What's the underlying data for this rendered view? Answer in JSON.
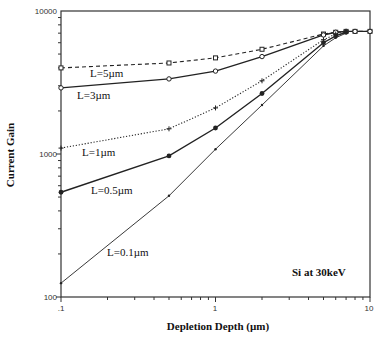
{
  "chart_data": {
    "type": "line",
    "title": "",
    "xlabel": "Depletion Depth (µm)",
    "ylabel": "Current Gain",
    "xscale": "log",
    "yscale": "log",
    "xlim": [
      0.1,
      10
    ],
    "ylim": [
      100,
      10000
    ],
    "x_tick_labels": [
      ".1",
      "1",
      "10"
    ],
    "y_tick_labels": [
      "100",
      "1000",
      "10000"
    ],
    "grid": false,
    "annotations": [
      "Si at 30keV"
    ],
    "series": [
      {
        "name": "L=5µm",
        "style": "dashed",
        "marker": "square",
        "x": [
          0.1,
          0.5,
          1,
          2,
          5,
          6,
          7,
          8,
          10
        ],
        "y": [
          4000,
          4330,
          4700,
          5400,
          6900,
          7100,
          7200,
          7200,
          7200
        ]
      },
      {
        "name": "L=3µm",
        "style": "solid",
        "marker": "circle-open",
        "x": [
          0.1,
          0.5,
          1,
          2,
          5,
          6,
          7,
          8,
          10
        ],
        "y": [
          2900,
          3350,
          3800,
          4800,
          6800,
          7100,
          7200,
          7200,
          7200
        ]
      },
      {
        "name": "L=1µm",
        "style": "dotted",
        "marker": "plus",
        "x": [
          0.1,
          0.5,
          1,
          2,
          5,
          6,
          7
        ],
        "y": [
          1100,
          1500,
          2100,
          3250,
          6300,
          6900,
          7200
        ]
      },
      {
        "name": "L=0.5µm",
        "style": "solid",
        "marker": "circle-filled",
        "x": [
          0.1,
          0.5,
          1,
          2,
          5,
          6,
          7
        ],
        "y": [
          540,
          970,
          1520,
          2650,
          6000,
          6700,
          7100
        ]
      },
      {
        "name": "L=0.1µm",
        "style": "solid-thin",
        "marker": "dot",
        "x": [
          0.1,
          0.5,
          1,
          2,
          5,
          6,
          7
        ],
        "y": [
          125,
          510,
          1080,
          2200,
          5700,
          6500,
          7000
        ]
      }
    ]
  },
  "labels": {
    "series_label_0": "L=5µm",
    "series_label_1": "L=3µm",
    "series_label_2": "L=1µm",
    "series_label_3": "L=0.5µm",
    "series_label_4": "L=0.1µm",
    "annotation": "Si at 30keV",
    "xlabel": "Depletion Depth (µm)",
    "ylabel": "Current Gain",
    "ytick_100": "100",
    "ytick_1000": "1000",
    "ytick_10000": "10000",
    "xtick_01": ".1",
    "xtick_1": "1",
    "xtick_10": "10"
  },
  "colors": {
    "line": "#222222",
    "axis": "#333333",
    "background": "#ffffff"
  }
}
